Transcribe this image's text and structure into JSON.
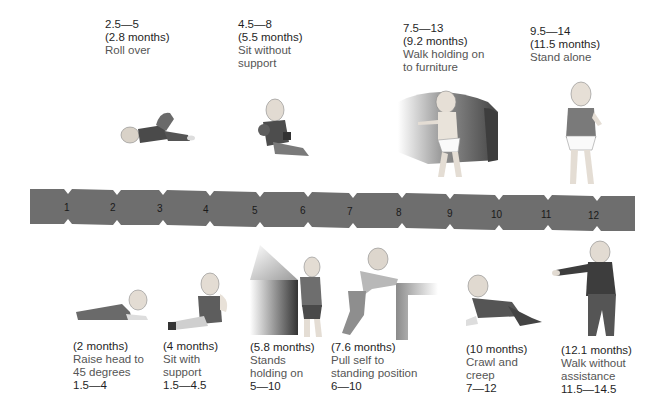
{
  "bar": {
    "color": "#6e6e6e",
    "months": [
      "1",
      "2",
      "3",
      "4",
      "5",
      "6",
      "7",
      "8",
      "9",
      "10",
      "11",
      "12"
    ]
  },
  "top_milestones": [
    {
      "range": "2.5—5",
      "average": "(2.8 months)",
      "description": "Roll over"
    },
    {
      "range": "4.5—8",
      "average": "(5.5 months)",
      "description": "Sit without support"
    },
    {
      "range": "7.5—13",
      "average": "(9.2 months)",
      "description": "Walk holding on to furniture"
    },
    {
      "range": "9.5—14",
      "average": "(11.5 months)",
      "description": "Stand alone"
    }
  ],
  "bottom_milestones": [
    {
      "average": "(2 months)",
      "description": "Raise head to 45 degrees",
      "range": "1.5—4"
    },
    {
      "average": "(4 months)",
      "description": "Sit with support",
      "range": "1.5—4.5"
    },
    {
      "average": "(5.8 months)",
      "description": "Stands holding on",
      "range": "5—10"
    },
    {
      "average": "(7.6 months)",
      "description": "Pull self to standing position",
      "range": "6—10"
    },
    {
      "average": "(10 months)",
      "description": "Crawl and creep",
      "range": "7—12"
    },
    {
      "average": "(12.1 months)",
      "description": "Walk without assistance",
      "range": "11.5—14.5"
    }
  ],
  "illustrations": {
    "top": [
      "baby-rolling-over",
      "baby-sitting-unsupported",
      "baby-cruising-sofa",
      "baby-standing-alone"
    ],
    "bottom": [
      "baby-raising-head",
      "baby-sitting-supported",
      "baby-standing-holding-box",
      "baby-pulling-to-stand",
      "baby-crawling",
      "toddler-walking"
    ]
  }
}
